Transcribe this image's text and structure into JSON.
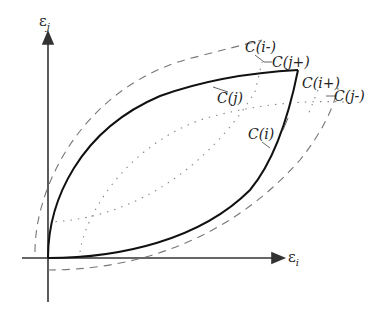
{
  "diagram": {
    "axes": {
      "x_label": "ε",
      "x_sub": "i",
      "y_label": "ε",
      "y_sub": "j"
    },
    "curves": {
      "c_j": "C(j)",
      "c_i": "C(i)",
      "c_i_minus": "C(i-)",
      "c_j_plus": "C(j+)",
      "c_i_plus": "C(i+)",
      "c_j_minus": "C(j-)"
    },
    "styles": {
      "solid": "#111111",
      "dashed": "#777777",
      "dotted": "#888888"
    }
  }
}
